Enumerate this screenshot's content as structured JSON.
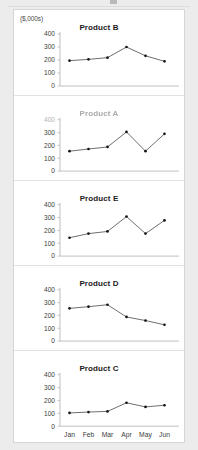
{
  "panel": {
    "units_label": "($,000s)"
  },
  "chart_data": [
    {
      "type": "line",
      "title": "Product B",
      "title_degraded": false,
      "xlabel": "",
      "ylabel": "($,000s)",
      "categories": [
        "Jan",
        "Feb",
        "Mar",
        "Apr",
        "May",
        "Jun"
      ],
      "values": [
        195,
        205,
        218,
        300,
        232,
        190
      ],
      "yticks": [
        0,
        100,
        200,
        300,
        400
      ],
      "ytick_labels": [
        "0",
        "100",
        "200",
        "300",
        "400"
      ],
      "ylim": [
        0,
        400
      ],
      "grid": false,
      "legend": "none",
      "x_axis_labels_visible": false
    },
    {
      "type": "line",
      "title": "Product A",
      "title_degraded": true,
      "xlabel": "",
      "ylabel": "",
      "categories": [
        "Jan",
        "Feb",
        "Mar",
        "Apr",
        "May",
        "Jun"
      ],
      "values": [
        155,
        172,
        188,
        305,
        155,
        290
      ],
      "yticks": [
        0,
        100,
        200,
        300,
        400
      ],
      "ytick_labels": [
        "0",
        "100",
        "200",
        "300",
        "400"
      ],
      "ytick_degraded": [
        false,
        false,
        false,
        false,
        true
      ],
      "ylim": [
        0,
        400
      ],
      "grid": false,
      "legend": "none",
      "x_axis_labels_visible": false
    },
    {
      "type": "line",
      "title": "Product E",
      "title_degraded": false,
      "xlabel": "",
      "ylabel": "",
      "categories": [
        "Jan",
        "Feb",
        "Mar",
        "Apr",
        "May",
        "Jun"
      ],
      "values": [
        143,
        175,
        192,
        308,
        175,
        278
      ],
      "yticks": [
        0,
        100,
        200,
        300,
        400
      ],
      "ytick_labels": [
        "0",
        "100",
        "200",
        "300",
        "400"
      ],
      "ylim": [
        0,
        400
      ],
      "grid": false,
      "legend": "none",
      "x_axis_labels_visible": false
    },
    {
      "type": "line",
      "title": "Product D",
      "title_degraded": false,
      "xlabel": "",
      "ylabel": "",
      "categories": [
        "Jan",
        "Feb",
        "Mar",
        "Apr",
        "May",
        "Jun"
      ],
      "values": [
        255,
        268,
        283,
        188,
        160,
        127
      ],
      "yticks": [
        0,
        100,
        200,
        300,
        400
      ],
      "ytick_labels": [
        "0",
        "100",
        "200",
        "300",
        "400"
      ],
      "ylim": [
        0,
        400
      ],
      "grid": false,
      "legend": "none",
      "x_axis_labels_visible": false
    },
    {
      "type": "line",
      "title": "Product C",
      "title_degraded": false,
      "xlabel": "",
      "ylabel": "",
      "categories": [
        "Jan",
        "Feb",
        "Mar",
        "Apr",
        "May",
        "Jun"
      ],
      "values": [
        103,
        110,
        115,
        182,
        150,
        163
      ],
      "yticks": [
        0,
        100,
        200,
        300,
        400
      ],
      "ytick_labels": [
        "0",
        "100",
        "200",
        "300",
        "400"
      ],
      "ylim": [
        0,
        400
      ],
      "grid": false,
      "legend": "none",
      "x_axis_labels_visible": true
    }
  ],
  "colors": {
    "background": "#ececed",
    "panel": "#ffffff",
    "panel_border": "#d6d6d8",
    "line": "#5e5e5e",
    "marker": "#161616",
    "axis": "#b0b0b2",
    "text": "#3d3d3d",
    "title": "#1b1b1b"
  }
}
